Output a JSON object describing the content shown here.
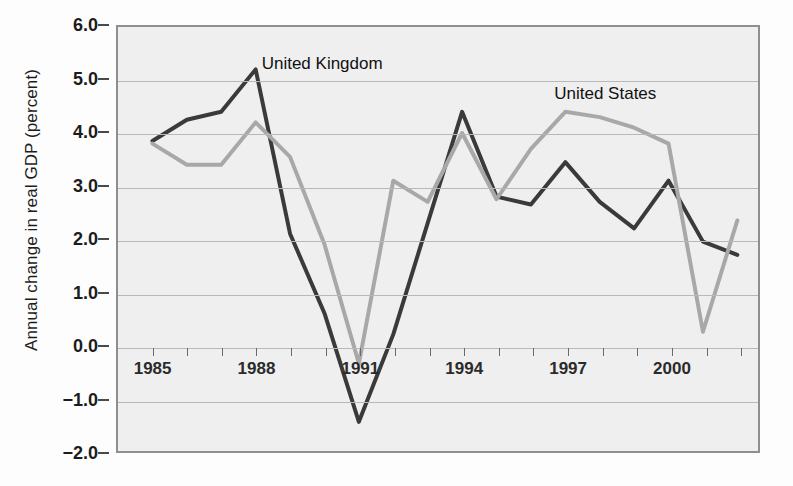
{
  "chart_data": {
    "type": "line",
    "title": "",
    "xlabel": "",
    "ylabel": "Annual change in real GDP (percent)",
    "xlim": [
      1984.0,
      2002.6
    ],
    "ylim": [
      -2.0,
      6.0
    ],
    "grid": true,
    "legend_position": "inline-annotation",
    "x": [
      1985,
      1986,
      1987,
      1988,
      1989,
      1990,
      1991,
      1992,
      1993,
      1994,
      1995,
      1996,
      1997,
      1998,
      1999,
      2000,
      2001,
      2002
    ],
    "x_tick_labels": [
      "1985",
      "1988",
      "1991",
      "1994",
      "1997",
      "2000"
    ],
    "x_tick_values": [
      1985,
      1988,
      1991,
      1994,
      1997,
      2000
    ],
    "y_tick_labels": [
      "6.0",
      "5.0",
      "4.0",
      "3.0",
      "2.0",
      "1.0",
      "0.0",
      "-1.0",
      "-2.0"
    ],
    "y_tick_values": [
      6.0,
      5.0,
      4.0,
      3.0,
      2.0,
      1.0,
      0.0,
      -1.0,
      -2.0
    ],
    "series": [
      {
        "name": "United Kingdom",
        "color": "#3a3a3a",
        "values": [
          3.85,
          4.25,
          4.4,
          5.2,
          2.1,
          0.6,
          -1.45,
          0.2,
          2.3,
          4.4,
          2.8,
          2.65,
          3.45,
          2.7,
          2.2,
          3.1,
          1.95,
          1.7
        ]
      },
      {
        "name": "United States",
        "color": "#a8a8a8",
        "values": [
          3.8,
          3.4,
          3.4,
          4.2,
          3.55,
          1.9,
          -0.35,
          3.1,
          2.7,
          4.0,
          2.75,
          3.7,
          4.4,
          4.3,
          4.1,
          3.8,
          0.25,
          2.35
        ]
      }
    ],
    "annotations": [
      {
        "text": "United Kingdom",
        "x": 1988.15,
        "y": 5.3
      },
      {
        "text": "United States",
        "x": 1996.6,
        "y": 4.75
      }
    ]
  }
}
